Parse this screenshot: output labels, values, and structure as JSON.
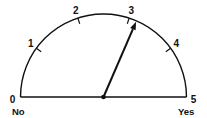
{
  "gauge": {
    "min": 0,
    "max": 5,
    "ticks": [
      "0",
      "1",
      "2",
      "3",
      "4",
      "5"
    ],
    "min_label": "No",
    "max_label": "Yes",
    "needle_value": 3.15,
    "ink_color": "#111111"
  }
}
